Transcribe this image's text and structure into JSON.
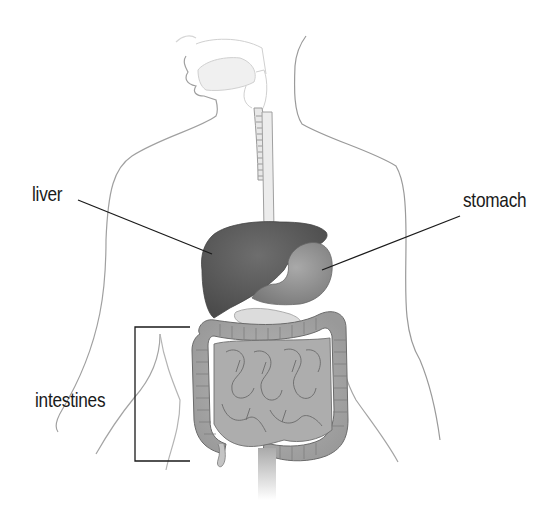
{
  "diagram": {
    "labels": {
      "liver": "liver",
      "stomach": "stomach",
      "intestines": "intestines"
    },
    "colors": {
      "background": "#ffffff",
      "outline": "#8a8a8a",
      "liver": "#5a5a5a",
      "stomach": "#8c8c8c",
      "intestines": "#a8a8a8",
      "intestine_outline": "#6a6a6a",
      "leader_line": "#1a1a1a",
      "label_text": "#1a1a1a"
    }
  }
}
